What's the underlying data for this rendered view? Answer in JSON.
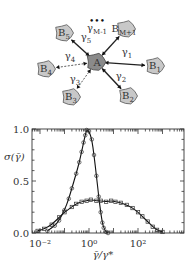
{
  "diagram": {
    "center_node": {
      "label": "A",
      "x": 96,
      "y": 62
    },
    "nodes": [
      {
        "label": "B",
        "sub": "1",
        "x": 155,
        "y": 66,
        "edge_label": "γ",
        "edge_sub": "1",
        "lx": 127,
        "ly": 55
      },
      {
        "label": "B",
        "sub": "2",
        "x": 128,
        "y": 96,
        "edge_label": "γ",
        "edge_sub": "2",
        "lx": 121,
        "ly": 79
      },
      {
        "label": "B",
        "sub": "3",
        "x": 71,
        "y": 97,
        "edge_label": "γ",
        "edge_sub": "3",
        "lx": 75,
        "ly": 82
      },
      {
        "label": "B",
        "sub": "4",
        "x": 46,
        "y": 69,
        "edge_label": "γ",
        "edge_sub": "4",
        "lx": 70,
        "ly": 59
      },
      {
        "label": "B",
        "sub": "5",
        "x": 64,
        "y": 33,
        "edge_label": "γ",
        "edge_sub": "5",
        "lx": 86,
        "ly": 40
      },
      {
        "label": "B",
        "sub": "M+1",
        "x": 126,
        "y": 29,
        "edge_label": "γ",
        "edge_sub": "M-1",
        "lx": 97,
        "ly": 31
      }
    ],
    "ellipsis": "•••"
  },
  "chart_data": {
    "type": "line",
    "title": "",
    "xlabel": "γ̄/γ*",
    "ylabel": "σ(γ̄)",
    "xscale": "log",
    "xlim": [
      0.005,
      5000
    ],
    "ylim": [
      0.0,
      1.0
    ],
    "x_tick_labels": [
      "10⁻²",
      "10⁰",
      "10²"
    ],
    "y_tick_labels": [
      "0.0",
      "0.5",
      "1.0"
    ],
    "grid": false,
    "legend": null,
    "series": [
      {
        "name": "narrow distribution (circles, with fit)",
        "marker": "circle",
        "x": [
          0.02,
          0.04,
          0.06,
          0.1,
          0.15,
          0.2,
          0.3,
          0.4,
          0.5,
          0.6,
          0.7,
          0.8,
          1.0,
          1.3,
          1.6,
          2.0,
          2.5,
          3.0,
          3.5,
          4.0,
          5.0,
          6.0
        ],
        "values": [
          0.02,
          0.07,
          0.12,
          0.22,
          0.33,
          0.43,
          0.57,
          0.68,
          0.78,
          0.87,
          0.94,
          0.99,
          0.98,
          0.9,
          0.75,
          0.55,
          0.35,
          0.2,
          0.1,
          0.05,
          0.01,
          0.0
        ]
      },
      {
        "name": "broad distribution (squares, with fit)",
        "marker": "square",
        "x": [
          0.008,
          0.015,
          0.03,
          0.06,
          0.1,
          0.2,
          0.3,
          0.5,
          0.8,
          1.2,
          2,
          3,
          5,
          8,
          12,
          20,
          35,
          60,
          100,
          150,
          250,
          400,
          600,
          1000
        ],
        "values": [
          0.02,
          0.04,
          0.08,
          0.15,
          0.2,
          0.25,
          0.28,
          0.3,
          0.31,
          0.32,
          0.31,
          0.31,
          0.3,
          0.31,
          0.3,
          0.29,
          0.27,
          0.24,
          0.2,
          0.16,
          0.11,
          0.06,
          0.03,
          0.01
        ]
      }
    ]
  }
}
